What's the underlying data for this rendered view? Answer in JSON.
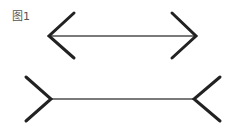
{
  "figure": {
    "label": "图1",
    "colors": {
      "shaft": "#7a7a7a",
      "arms": "#222222",
      "label": "#555555",
      "background": "#ffffff"
    },
    "top_figure": {
      "type": "arrowheads-outward",
      "shaft": {
        "x1": 49,
        "y1": 36,
        "x2": 196,
        "y2": 36
      },
      "left_arms": [
        [
          74,
          13
        ],
        [
          49,
          36
        ],
        [
          74,
          58
        ]
      ],
      "right_arms": [
        [
          172,
          13
        ],
        [
          196,
          36
        ],
        [
          172,
          58
        ]
      ]
    },
    "bottom_figure": {
      "type": "fins-inward",
      "shaft": {
        "x1": 51,
        "y1": 99,
        "x2": 194,
        "y2": 99
      },
      "left_arms": [
        [
          26,
          77
        ],
        [
          51,
          99
        ],
        [
          26,
          121
        ]
      ],
      "right_arms": [
        [
          220,
          77
        ],
        [
          194,
          99
        ],
        [
          220,
          121
        ]
      ]
    }
  }
}
